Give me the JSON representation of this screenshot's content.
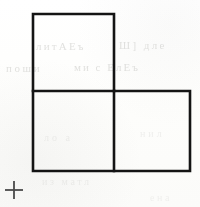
{
  "page": {
    "background_color": "#fdfdfc",
    "ink_color": "#1a1a1a",
    "width": 200,
    "height": 207
  },
  "figure": {
    "name": "L-shaped tromino",
    "description": "Three congruent squares joined edge to edge forming an L shape",
    "stroke_color": "#141414",
    "stroke_width": 2.6,
    "fill": "none",
    "square_size": 81,
    "squares": [
      {
        "label": "upper-left-square",
        "x": 33,
        "y": 14,
        "width": 81,
        "height": 77
      },
      {
        "label": "lower-left-square",
        "x": 33,
        "y": 91,
        "width": 81,
        "height": 80
      },
      {
        "label": "lower-right-square",
        "x": 114,
        "y": 91,
        "width": 76,
        "height": 80
      }
    ],
    "outline_path": "M 33 14 L 114 14 L 114 91 L 190 91 L 190 171 L 33 171 Z",
    "interior_segments": [
      {
        "label": "horizontal-divider",
        "x1": 33,
        "y1": 91,
        "x2": 114,
        "y2": 91
      },
      {
        "label": "vertical-divider",
        "x1": 114,
        "y1": 91,
        "x2": 114,
        "y2": 171
      }
    ]
  },
  "registration_mark": {
    "name": "crosshair registration mark",
    "symbol": "+",
    "center_x": 14,
    "center_y": 190,
    "arm_length": 9,
    "stroke_width": 1.8,
    "color": "#4a4a4a"
  },
  "ghost_text": {
    "note": "faint bleed-through from the reverse side of the scanned page",
    "rows": [
      "литАЕъ",
      "Ш] дле",
      "поши",
      "ми с ЕлЕъ",
      "ло а",
      "нил",
      "из матл",
      "ена"
    ]
  }
}
